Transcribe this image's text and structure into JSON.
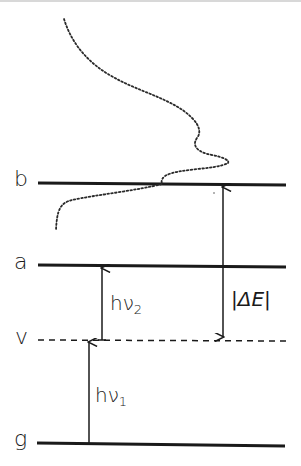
{
  "diagram": {
    "type": "energy-level-diagram",
    "levels": [
      {
        "id": "b",
        "label": "b",
        "style": "solid",
        "y": 184
      },
      {
        "id": "a",
        "label": "a",
        "style": "solid",
        "y": 266
      },
      {
        "id": "v",
        "label": "v",
        "style": "dashed",
        "y": 340
      },
      {
        "id": "g",
        "label": "g",
        "style": "solid",
        "y": 444
      }
    ],
    "transitions": [
      {
        "id": "hv1",
        "label_main": "hν",
        "label_sub": "1",
        "from": "g",
        "to": "v",
        "direction": "up"
      },
      {
        "id": "hv2",
        "label_main": "hν",
        "label_sub": "2",
        "from": "v",
        "to": "a",
        "direction": "up"
      },
      {
        "id": "delta-e",
        "label": "|ΔE|",
        "from": "b",
        "to": "v",
        "direction": "both"
      }
    ],
    "curve": {
      "style": "dotted",
      "description": "lineshape/spectral profile centred on level b"
    },
    "colors": {
      "ink": "#1a1a1a",
      "background": "#ffffff"
    }
  }
}
